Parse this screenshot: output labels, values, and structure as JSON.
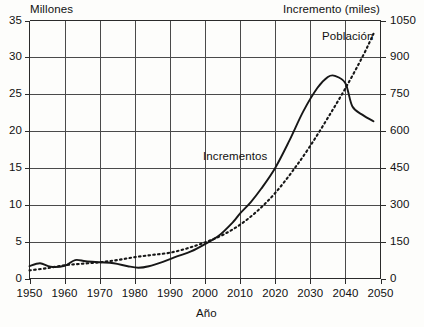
{
  "chart_data": {
    "type": "line",
    "title": "",
    "xlabel": "Año",
    "left_axis_title": "Millones",
    "right_axis_title": "Incremento (miles)",
    "xlim": [
      1950,
      2050
    ],
    "ylim_left": [
      0,
      35
    ],
    "ylim_right": [
      0,
      1050
    ],
    "x_ticks": [
      1950,
      1960,
      1970,
      1980,
      1990,
      2000,
      2010,
      2020,
      2030,
      2040,
      2050
    ],
    "y_ticks_left": [
      0,
      5,
      10,
      15,
      20,
      25,
      30,
      35
    ],
    "y_ticks_right": [
      0,
      150,
      300,
      450,
      600,
      750,
      900,
      1050
    ],
    "grid": true,
    "legend_position": "inline-annotations",
    "series": [
      {
        "name": "Población",
        "axis": "left",
        "units": "millones",
        "style": "dotted",
        "color": "#1a1a1a",
        "x": [
          1950,
          1955,
          1960,
          1965,
          1970,
          1975,
          1980,
          1985,
          1990,
          1995,
          2000,
          2005,
          2010,
          2015,
          2020,
          2025,
          2030,
          2035,
          2040,
          2045,
          2048
        ],
        "values": [
          1.1,
          1.4,
          1.8,
          2.0,
          2.2,
          2.5,
          2.9,
          3.2,
          3.5,
          4.1,
          4.9,
          5.9,
          7.3,
          9.2,
          11.6,
          14.6,
          18.0,
          21.8,
          25.8,
          30.2,
          33.2
        ]
      },
      {
        "name": "Incrementos",
        "axis": "right",
        "units": "miles",
        "style": "solid",
        "color": "#1a1a1a",
        "x": [
          1950,
          1953,
          1956,
          1960,
          1963,
          1966,
          1970,
          1974,
          1978,
          1981,
          1984,
          1988,
          1992,
          1996,
          2000,
          2004,
          2008,
          2010,
          2013,
          2016,
          2020,
          2024,
          2028,
          2032,
          2035,
          2037,
          2040,
          2042,
          2045,
          2048
        ],
        "values": [
          50,
          62,
          48,
          52,
          75,
          70,
          66,
          62,
          50,
          44,
          50,
          68,
          90,
          110,
          140,
          175,
          230,
          265,
          310,
          365,
          450,
          560,
          680,
          775,
          820,
          825,
          795,
          700,
          665,
          640
        ]
      }
    ],
    "annotations": [
      {
        "text": "Población",
        "x": 2033,
        "y_left": 32.6
      },
      {
        "text": "Incrementos",
        "x": 2003,
        "y_left": 16.8
      }
    ]
  }
}
